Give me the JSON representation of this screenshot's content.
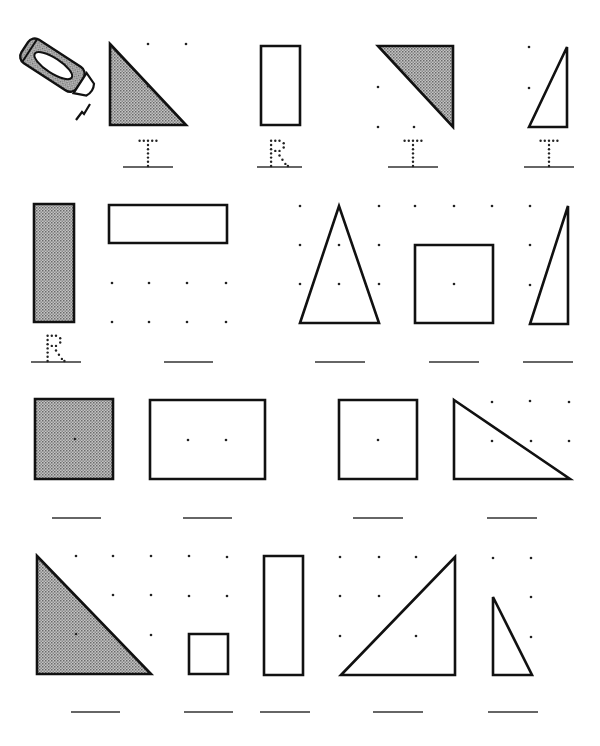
{
  "worksheet": {
    "instruction_icon": "crayon-icon",
    "fill_color": "#9a9a9a",
    "stroke_color": "#111111",
    "answer_key": {
      "T": "triangle",
      "R": "rectangle"
    },
    "rows": [
      {
        "row": 1,
        "items": [
          {
            "shape": "triangle",
            "shaded": true,
            "points": [
              [
                110,
                44
              ],
              [
                186,
                125
              ],
              [
                110,
                125
              ]
            ],
            "dots": [
              [
                148,
                44
              ],
              [
                186,
                44
              ],
              [
                148,
                86
              ]
            ],
            "label": "T",
            "line": [
              123,
              173
            ]
          },
          {
            "shape": "rectangle",
            "shaded": false,
            "points": [
              [
                261,
                46
              ],
              [
                300,
                46
              ],
              [
                300,
                125
              ],
              [
                261,
                125
              ]
            ],
            "dots": [],
            "label": "R",
            "line": [
              257,
              302
            ]
          },
          {
            "shape": "triangle",
            "shaded": true,
            "points": [
              [
                378,
                46
              ],
              [
                453,
                46
              ],
              [
                453,
                127
              ]
            ],
            "dots": [
              [
                378,
                87
              ],
              [
                378,
                127
              ],
              [
                414,
                127
              ]
            ],
            "label": "T",
            "line": [
              388,
              438
            ]
          },
          {
            "shape": "triangle",
            "shaded": false,
            "points": [
              [
                529,
                127
              ],
              [
                567,
                47
              ],
              [
                567,
                127
              ]
            ],
            "dots": [
              [
                529,
                47
              ],
              [
                529,
                88
              ]
            ],
            "label": "T",
            "line": [
              524,
              574
            ]
          }
        ]
      },
      {
        "row": 2,
        "items": [
          {
            "shape": "rectangle",
            "shaded": true,
            "points": [
              [
                34,
                204
              ],
              [
                74,
                204
              ],
              [
                74,
                322
              ],
              [
                34,
                322
              ]
            ],
            "dots": [],
            "label": "R",
            "line": [
              31,
              81
            ]
          },
          {
            "shape": "rectangle",
            "shaded": false,
            "points": [
              [
                109,
                205
              ],
              [
                227,
                205
              ],
              [
                227,
                243
              ],
              [
                109,
                243
              ]
            ],
            "dots": [
              [
                112,
                283
              ],
              [
                149,
                283
              ],
              [
                187,
                283
              ],
              [
                226,
                283
              ],
              [
                112,
                322
              ],
              [
                149,
                322
              ],
              [
                187,
                322
              ],
              [
                226,
                322
              ]
            ],
            "label": "",
            "line": [
              164,
              213
            ]
          },
          {
            "shape": "triangle",
            "shaded": false,
            "points": [
              [
                300,
                323
              ],
              [
                339,
                206
              ],
              [
                379,
                323
              ]
            ],
            "dots": [
              [
                300,
                206
              ],
              [
                379,
                206
              ],
              [
                300,
                245
              ],
              [
                339,
                245
              ],
              [
                379,
                245
              ],
              [
                300,
                284
              ],
              [
                339,
                284
              ],
              [
                379,
                284
              ]
            ],
            "label": "",
            "line": [
              315,
              365
            ]
          },
          {
            "shape": "rectangle",
            "shaded": false,
            "points": [
              [
                415,
                245
              ],
              [
                493,
                245
              ],
              [
                493,
                323
              ],
              [
                415,
                323
              ]
            ],
            "dots": [
              [
                415,
                206
              ],
              [
                454,
                206
              ],
              [
                492,
                206
              ],
              [
                454,
                284
              ]
            ],
            "label": "",
            "line": [
              429,
              479
            ]
          },
          {
            "shape": "triangle",
            "shaded": false,
            "points": [
              [
                530,
                324
              ],
              [
                568,
                206
              ],
              [
                568,
                324
              ]
            ],
            "dots": [
              [
                530,
                206
              ],
              [
                530,
                245
              ],
              [
                530,
                285
              ]
            ],
            "label": "",
            "line": [
              523,
              573
            ]
          }
        ]
      },
      {
        "row": 3,
        "items": [
          {
            "shape": "rectangle",
            "shaded": true,
            "points": [
              [
                35,
                399
              ],
              [
                113,
                399
              ],
              [
                113,
                479
              ],
              [
                35,
                479
              ]
            ],
            "dots": [
              [
                75,
                439
              ]
            ],
            "label": "",
            "line": [
              52,
              101
            ]
          },
          {
            "shape": "rectangle",
            "shaded": false,
            "points": [
              [
                150,
                400
              ],
              [
                265,
                400
              ],
              [
                265,
                479
              ],
              [
                150,
                479
              ]
            ],
            "dots": [
              [
                188,
                440
              ],
              [
                226,
                440
              ]
            ],
            "label": "",
            "line": [
              183,
              232
            ]
          },
          {
            "shape": "rectangle",
            "shaded": false,
            "points": [
              [
                339,
                400
              ],
              [
                417,
                400
              ],
              [
                417,
                479
              ],
              [
                339,
                479
              ]
            ],
            "dots": [
              [
                378,
                440
              ]
            ],
            "label": "",
            "line": [
              353,
              403
            ]
          },
          {
            "shape": "triangle",
            "shaded": false,
            "points": [
              [
                454,
                400
              ],
              [
                570,
                479
              ],
              [
                454,
                479
              ]
            ],
            "dots": [
              [
                492,
                402
              ],
              [
                530,
                401
              ],
              [
                569,
                402
              ],
              [
                492,
                441
              ],
              [
                531,
                441
              ],
              [
                569,
                441
              ]
            ],
            "label": "",
            "line": [
              487,
              537
            ]
          }
        ]
      },
      {
        "row": 4,
        "items": [
          {
            "shape": "triangle",
            "shaded": true,
            "points": [
              [
                37,
                556
              ],
              [
                151,
                674
              ],
              [
                37,
                674
              ]
            ],
            "dots": [
              [
                76,
                556
              ],
              [
                113,
                556
              ],
              [
                151,
                556
              ],
              [
                113,
                595
              ],
              [
                151,
                595
              ],
              [
                76,
                634
              ],
              [
                151,
                635
              ]
            ],
            "label": "",
            "line": [
              71,
              120
            ]
          },
          {
            "shape": "rectangle",
            "shaded": false,
            "points": [
              [
                189,
                634
              ],
              [
                228,
                634
              ],
              [
                228,
                674
              ],
              [
                189,
                674
              ]
            ],
            "dots": [
              [
                189,
                556
              ],
              [
                227,
                557
              ],
              [
                189,
                596
              ],
              [
                227,
                596
              ]
            ],
            "label": "",
            "line": [
              184,
              233
            ]
          },
          {
            "shape": "rectangle",
            "shaded": false,
            "points": [
              [
                264,
                556
              ],
              [
                303,
                556
              ],
              [
                303,
                675
              ],
              [
                264,
                675
              ]
            ],
            "dots": [],
            "label": "",
            "line": [
              260,
              310
            ]
          },
          {
            "shape": "triangle",
            "shaded": false,
            "points": [
              [
                341,
                675
              ],
              [
                455,
                557
              ],
              [
                455,
                675
              ]
            ],
            "dots": [
              [
                340,
                557
              ],
              [
                379,
                557
              ],
              [
                416,
                557
              ],
              [
                340,
                596
              ],
              [
                379,
                596
              ],
              [
                340,
                636
              ],
              [
                416,
                636
              ]
            ],
            "label": "",
            "line": [
              373,
              423
            ]
          },
          {
            "shape": "triangle",
            "shaded": false,
            "points": [
              [
                493,
                597
              ],
              [
                532,
                675
              ],
              [
                493,
                675
              ]
            ],
            "dots": [
              [
                493,
                558
              ],
              [
                531,
                558
              ],
              [
                531,
                597
              ],
              [
                531,
                637
              ]
            ],
            "label": "",
            "line": [
              488,
              538
            ]
          }
        ]
      }
    ],
    "line_y": [
      167,
      362,
      518,
      712
    ]
  }
}
